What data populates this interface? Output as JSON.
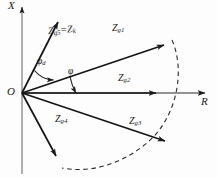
{
  "figure": {
    "kind": "impedance-plane-vector-diagram",
    "background_color": "#fdfdfd",
    "line_color": "#1a1a1a"
  },
  "axes": {
    "vertical": {
      "label": "X",
      "name": "reactance-axis",
      "x": 22,
      "y_top": 4,
      "y_bottom": 174,
      "arrow": "up"
    },
    "horizontal": {
      "label": "R",
      "name": "resistance-axis",
      "y": 93,
      "x_left": 22,
      "x_right": 212,
      "arrow": "right"
    },
    "origin": {
      "label": "O",
      "x": 22,
      "y": 93
    }
  },
  "vectors": [
    {
      "id": "zg5",
      "label": "Z",
      "sub": "g5",
      "label_full": "Zg5 = Zk",
      "equals_label": "Z",
      "equals_sub": "k",
      "tip_x": 57,
      "tip_y": 18,
      "label_x": 48,
      "label_y": 31
    },
    {
      "id": "zg1",
      "label": "Z",
      "sub": "g1",
      "tip_x": 169,
      "tip_y": 42,
      "label_x": 112,
      "label_y": 28
    },
    {
      "id": "zg2",
      "label": "Z",
      "sub": "g2",
      "tip_x": 161,
      "tip_y": 93,
      "label_x": 118,
      "label_y": 78
    },
    {
      "id": "zg3",
      "label": "Z",
      "sub": "g3",
      "tip_x": 170,
      "tip_y": 144,
      "label_x": 129,
      "label_y": 121
    },
    {
      "id": "zg4",
      "label": "Z",
      "sub": "g4",
      "tip_x": 58,
      "tip_y": 161,
      "label_x": 55,
      "label_y": 118
    }
  ],
  "angles": [
    {
      "id": "phi-d",
      "label": "φ",
      "sub": "d",
      "label_x": 37,
      "label_y": 62,
      "between": "zg5-and-zg1"
    },
    {
      "id": "phi",
      "label": "φ",
      "sub": "",
      "label_x": 68,
      "label_y": 72,
      "between": "zg1-and-R-axis"
    }
  ],
  "arc": {
    "name": "constant-magnitude-dashed-arc",
    "style": "dashed",
    "from_x": 172,
    "from_y": 40,
    "to_x": 62,
    "to_y": 168
  }
}
